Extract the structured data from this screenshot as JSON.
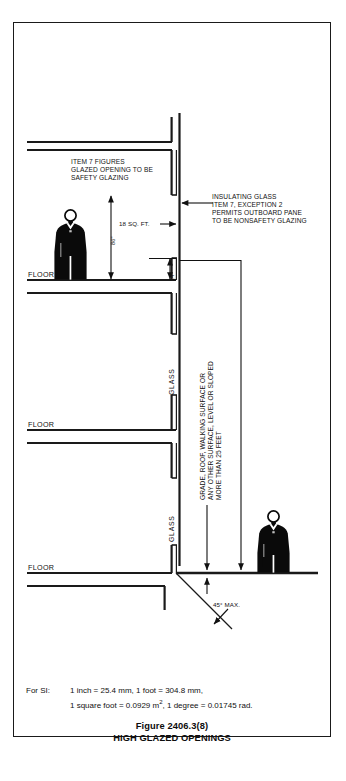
{
  "figure": {
    "type": "architectural-section-diagram",
    "caption_number": "Figure 2406.3(8)",
    "caption_title": "HIGH GLAZED OPENINGS"
  },
  "annotations": {
    "item7_note": "ITEM 7 FIGURES\nGLAZED OPENING TO BE\nSAFETY GLAZING",
    "insulating_note": "INSULATING GLASS\nITEM 7, EXCEPTION 2\nPERMITS OUTBOARD PANE\nTO BE NONSAFETY GLAZING",
    "surface_note": "GRADE, ROOF, WALKING SURFACE OR\nANY OTHER SURFACE, LEVEL OR SLOPED\nMORE THAN 25 FEET",
    "surface_note_line1": "GRADE, ROOF, WALKING SURFACE OR",
    "surface_note_line2": "ANY OTHER SURFACE, LEVEL OR SLOPED",
    "surface_note_line3": "MORE THAN 25 FEET"
  },
  "dimensions": {
    "height_86": "86\"",
    "height_14": "14\"",
    "area_18sqft": "18 SQ. FT.",
    "angle_45max": "45° MAX."
  },
  "labels": {
    "floor_1": "FLOOR",
    "floor_2": "FLOOR",
    "floor_3": "FLOOR",
    "glass_1": "GLASS",
    "glass_2": "GLASS"
  },
  "si_note": {
    "prefix": "For SI:",
    "line1": "1 inch = 25.4 mm, 1 foot = 304.8 mm,",
    "line2_a": "1 square foot = 0.0929 m",
    "line2_sup": "2",
    "line2_b": ", 1 degree = 0.01745 rad."
  },
  "colors": {
    "line": "#1a1a1a",
    "figure_fill": "#0a0a0a",
    "background": "#ffffff"
  }
}
